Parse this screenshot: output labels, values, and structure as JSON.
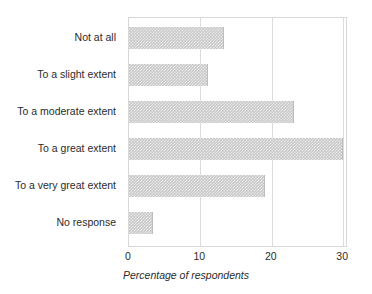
{
  "chart_data": {
    "type": "bar",
    "orientation": "horizontal",
    "title": "",
    "xlabel": "Percentage of respondents",
    "ylabel": "",
    "categories": [
      "Not at all",
      "To a slight extent",
      "To a moderate extent",
      "To a great extent",
      "To a very great extent",
      "No response"
    ],
    "values": [
      13.3,
      11.1,
      23.1,
      30.0,
      19.0,
      3.3
    ],
    "xlim": [
      0,
      30.4
    ],
    "xticks": [
      0,
      10,
      20,
      30
    ],
    "xtick_labels": [
      "0",
      "10",
      "20",
      "30"
    ],
    "grid": "vertical",
    "legend": "none",
    "bar_color": "#c9c9c9",
    "bar_edge_color": "#bdbdbd",
    "grid_color": "#dcdcdc",
    "frame_color": "#d8d8d8",
    "background_color": "#ffffff",
    "text_color": "#2b2b2b"
  }
}
